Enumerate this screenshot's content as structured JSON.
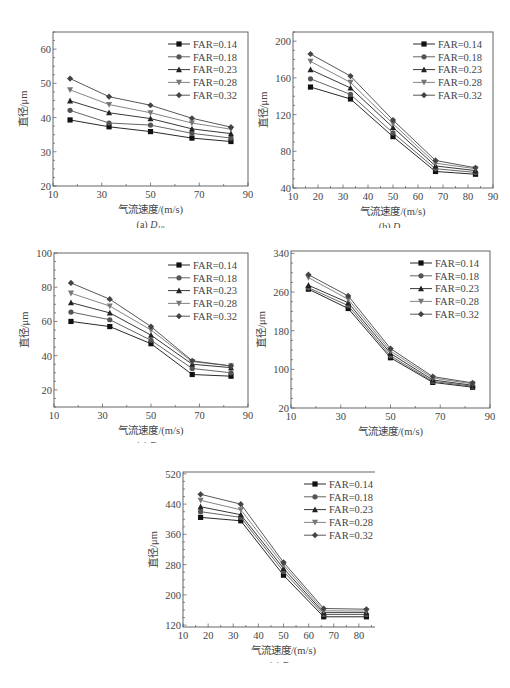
{
  "chart_data": [
    {
      "id": "a",
      "type": "line",
      "caption": "(a) D10",
      "caption_prefix": "(a) ",
      "caption_symbol": "D",
      "caption_sub": "10",
      "xlabel": "气流速度/(m/s)",
      "ylabel": "直径/μm",
      "x": [
        17,
        33,
        50,
        67,
        83
      ],
      "xlim": [
        10,
        90
      ],
      "xticks": [
        10,
        30,
        50,
        70,
        90
      ],
      "ylim": [
        20,
        65
      ],
      "yticks": [
        20,
        30,
        40,
        50,
        60
      ],
      "legend_position": "upper right",
      "series": [
        {
          "name": "FAR=0.14",
          "marker": "square",
          "values": [
            39.3,
            37.3,
            35.9,
            34.0,
            33.0
          ]
        },
        {
          "name": "FAR=0.18",
          "marker": "circle",
          "values": [
            42.1,
            38.4,
            37.8,
            35.4,
            34.0
          ]
        },
        {
          "name": "FAR=0.23",
          "marker": "triangle-up",
          "values": [
            44.9,
            41.4,
            39.7,
            36.7,
            35.3
          ]
        },
        {
          "name": "FAR=0.28",
          "marker": "triangle-down",
          "values": [
            48.1,
            43.8,
            41.4,
            38.4,
            36.6
          ]
        },
        {
          "name": "FAR=0.32",
          "marker": "diamond",
          "values": [
            51.4,
            46.1,
            43.6,
            39.8,
            37.2
          ]
        }
      ]
    },
    {
      "id": "b",
      "type": "line",
      "caption": "(b) D32",
      "caption_prefix": "(b) ",
      "caption_symbol": "D",
      "caption_sub": "32",
      "xlabel": "气流速度/(m/s)",
      "ylabel": "直径/μm",
      "x": [
        17,
        33,
        50,
        67,
        83
      ],
      "xlim": [
        10,
        90
      ],
      "xticks": [
        10,
        20,
        30,
        40,
        50,
        60,
        70,
        80,
        90
      ],
      "ylim": [
        40,
        210
      ],
      "yticks": [
        40,
        80,
        120,
        160,
        200
      ],
      "legend_position": "upper right",
      "series": [
        {
          "name": "FAR=0.14",
          "marker": "square",
          "values": [
            150,
            137,
            96,
            58,
            55
          ]
        },
        {
          "name": "FAR=0.18",
          "marker": "circle",
          "values": [
            159,
            142,
            100,
            61,
            57
          ]
        },
        {
          "name": "FAR=0.23",
          "marker": "triangle-up",
          "values": [
            169,
            149,
            106,
            64,
            59
          ]
        },
        {
          "name": "FAR=0.28",
          "marker": "triangle-down",
          "values": [
            178,
            155,
            110,
            67,
            61
          ]
        },
        {
          "name": "FAR=0.32",
          "marker": "diamond",
          "values": [
            186,
            162,
            114,
            70,
            62
          ]
        }
      ]
    },
    {
      "id": "c",
      "type": "line",
      "caption": "(c) D0.1",
      "caption_prefix": "(c) ",
      "caption_symbol": "D",
      "caption_sub": "0.1",
      "xlabel": "气流速度/(m/s)",
      "ylabel": "直径/μm",
      "x": [
        17,
        33,
        50,
        67,
        83
      ],
      "xlim": [
        10,
        90
      ],
      "xticks": [
        10,
        30,
        50,
        70,
        90
      ],
      "ylim": [
        10,
        100
      ],
      "yticks": [
        20,
        40,
        60,
        80,
        100
      ],
      "legend_position": "upper right",
      "series": [
        {
          "name": "FAR=0.14",
          "marker": "square",
          "values": [
            60,
            57,
            47,
            29,
            28
          ]
        },
        {
          "name": "FAR=0.18",
          "marker": "circle",
          "values": [
            65.5,
            61,
            49,
            32.5,
            30
          ]
        },
        {
          "name": "FAR=0.23",
          "marker": "triangle-up",
          "values": [
            71,
            65,
            52,
            35,
            33
          ]
        },
        {
          "name": "FAR=0.28",
          "marker": "triangle-down",
          "values": [
            76.5,
            69,
            55,
            36.5,
            34
          ]
        },
        {
          "name": "FAR=0.32",
          "marker": "diamond",
          "values": [
            82.5,
            73,
            57,
            37,
            34
          ]
        }
      ]
    },
    {
      "id": "d",
      "type": "line",
      "caption": "(d) D0.5",
      "caption_prefix": "(d) ",
      "caption_symbol": "D",
      "caption_sub": "0.5",
      "xlabel": "气流速度/(m/s)",
      "ylabel": "直径/μm",
      "x": [
        17,
        33,
        50,
        67,
        83
      ],
      "xlim": [
        10,
        90
      ],
      "xticks": [
        10,
        30,
        50,
        70,
        90
      ],
      "ylim": [
        20,
        345
      ],
      "yticks": [
        20,
        100,
        180,
        260,
        340
      ],
      "legend_position": "upper right",
      "series": [
        {
          "name": "FAR=0.14",
          "marker": "square",
          "values": [
            266,
            226,
            124,
            73,
            63
          ]
        },
        {
          "name": "FAR=0.18",
          "marker": "circle",
          "values": [
            269,
            232,
            128,
            75,
            65
          ]
        },
        {
          "name": "FAR=0.23",
          "marker": "triangle-up",
          "values": [
            274,
            238,
            133,
            78,
            67
          ]
        },
        {
          "name": "FAR=0.28",
          "marker": "triangle-down",
          "values": [
            290,
            245,
            138,
            82,
            70
          ]
        },
        {
          "name": "FAR=0.32",
          "marker": "diamond",
          "values": [
            296,
            252,
            143,
            85,
            72
          ]
        }
      ]
    },
    {
      "id": "e",
      "type": "line",
      "caption": "(e) D0.9",
      "caption_prefix": "(e) ",
      "caption_symbol": "D",
      "caption_sub": "0.9",
      "xlabel": "气流速度/(m/s)",
      "ylabel": "直径/μm",
      "x": [
        17,
        33,
        50,
        66,
        83
      ],
      "xlim": [
        10,
        90
      ],
      "xticks": [
        10,
        20,
        30,
        40,
        50,
        60,
        70,
        80,
        90
      ],
      "ylim": [
        115,
        525
      ],
      "yticks": [
        120,
        200,
        280,
        360,
        440,
        520
      ],
      "legend_position": "upper right",
      "series": [
        {
          "name": "FAR=0.14",
          "marker": "square",
          "values": [
            405,
            396,
            252,
            142,
            142
          ]
        },
        {
          "name": "FAR=0.18",
          "marker": "circle",
          "values": [
            420,
            405,
            262,
            148,
            148
          ]
        },
        {
          "name": "FAR=0.23",
          "marker": "triangle-up",
          "values": [
            433,
            412,
            270,
            153,
            153
          ]
        },
        {
          "name": "FAR=0.28",
          "marker": "triangle-down",
          "values": [
            450,
            425,
            279,
            158,
            157
          ]
        },
        {
          "name": "FAR=0.32",
          "marker": "diamond",
          "values": [
            466,
            440,
            286,
            164,
            162
          ]
        }
      ]
    }
  ],
  "layout": {
    "panels": [
      {
        "id": "a",
        "left": 0,
        "top": 0,
        "plot": {
          "x": 53,
          "y": 32,
          "w": 195,
          "h": 154
        }
      },
      {
        "id": "b",
        "left": 255,
        "top": 0,
        "plot": {
          "x": 38,
          "y": 32,
          "w": 200,
          "h": 156
        }
      },
      {
        "id": "c",
        "left": 0,
        "top": 215,
        "plot": {
          "x": 54,
          "y": 38,
          "w": 194,
          "h": 154
        }
      },
      {
        "id": "d",
        "left": 255,
        "top": 215,
        "plot": {
          "x": 36,
          "y": 36,
          "w": 199,
          "h": 157
        }
      },
      {
        "id": "e",
        "left": 120,
        "top": 435,
        "plot": {
          "x": 63,
          "y": 37,
          "w": 201,
          "h": 155
        }
      }
    ],
    "series_colors": [
      "#111111",
      "#555555",
      "#222222",
      "#777777",
      "#444444"
    ]
  }
}
